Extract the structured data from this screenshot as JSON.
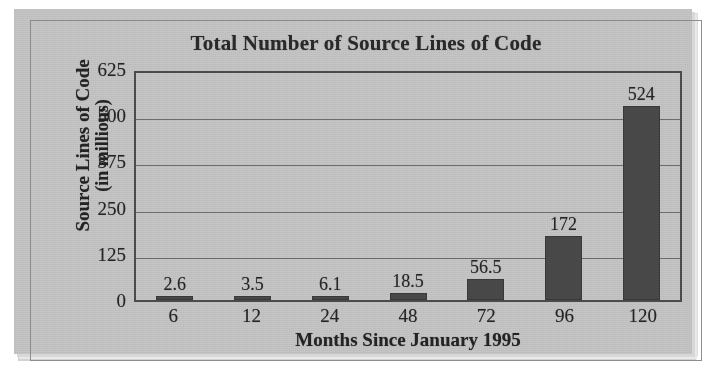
{
  "chart_data": {
    "type": "bar",
    "title": "Total Number of Source Lines of Code",
    "xlabel": "Months Since January 1995",
    "ylabel_line1": "Source Lines of Code",
    "ylabel_line2": "(in millions)",
    "categories": [
      "6",
      "12",
      "24",
      "48",
      "72",
      "96",
      "120"
    ],
    "values": [
      2.6,
      3.5,
      6.1,
      18.5,
      56.5,
      172,
      524
    ],
    "value_labels": [
      "2.6",
      "3.5",
      "6.1",
      "18.5",
      "56.5",
      "172",
      "524"
    ],
    "yticks": [
      625,
      500,
      375,
      250,
      125,
      0
    ],
    "ytick_labels": [
      "625",
      "500",
      "375",
      "250",
      "125",
      "0"
    ],
    "ylim": [
      0,
      625
    ],
    "grid": true,
    "legend": "none",
    "series": [
      {
        "name": "Source Lines of Code",
        "values": [
          2.6,
          3.5,
          6.1,
          18.5,
          56.5,
          172,
          524
        ]
      }
    ],
    "colors": {
      "bar": "#4a4a4a",
      "background": "#c6c6c6",
      "axis": "#4d4d4d",
      "grid": "#6e6e6e",
      "text": "#262626"
    }
  }
}
